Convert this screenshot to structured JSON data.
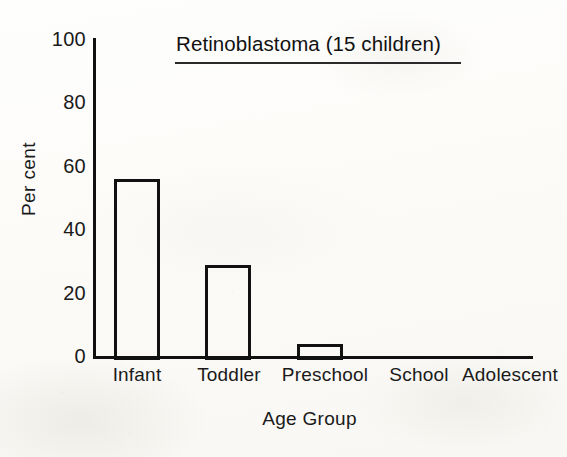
{
  "chart_data": {
    "type": "bar",
    "title": "Retinoblastoma (15 children)",
    "xlabel": "Age Group",
    "ylabel": "Per cent",
    "categories": [
      "Infant",
      "Toddler",
      "Preschool",
      "School",
      "Adolescent"
    ],
    "values": [
      56,
      29,
      4,
      0,
      0
    ],
    "ylim": [
      0,
      100
    ],
    "yticks": [
      0,
      20,
      40,
      60,
      80,
      100
    ],
    "ytick_labels": [
      "0",
      "20",
      "40",
      "60",
      "80",
      "100"
    ],
    "grid": false,
    "legend": "none",
    "series": [
      {
        "name": "Per cent of children",
        "values": [
          56,
          29,
          4,
          0,
          0
        ]
      }
    ],
    "annotations": [
      {
        "text": "Retinoblastoma (15 children)",
        "style": "underlined-title"
      }
    ],
    "bar_style": {
      "fill": "none",
      "edge_color": "#111111",
      "edge_width": 3
    }
  },
  "axis": {
    "y_tick_0": "0",
    "y_tick_20": "20",
    "y_tick_40": "40",
    "y_tick_60": "60",
    "y_tick_80": "80",
    "y_tick_100": "100",
    "y_title": "Per cent",
    "x_title": "Age Group",
    "x_tick_0": "Infant",
    "x_tick_1": "Toddler",
    "x_tick_2": "Preschool",
    "x_tick_3": "School",
    "x_tick_4": "Adolescent"
  },
  "colors": {
    "ink": "#111111",
    "paper": "#fdfdfb"
  }
}
